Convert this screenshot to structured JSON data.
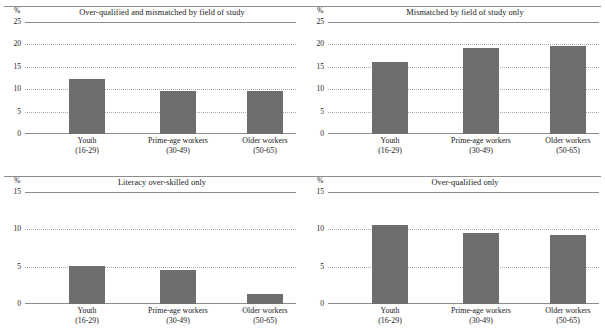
{
  "figure": {
    "bar_color": "#6e6e6e",
    "axis_color": "#8c8c8c",
    "grid_color": "#a8a8a8",
    "background": "#ffffff",
    "percent_symbol": "%"
  },
  "categories": [
    {
      "line1": "Youth",
      "line2": "(16-29)"
    },
    {
      "line1": "Prime-age workers",
      "line2": "(30-49)"
    },
    {
      "line1": "Older workers",
      "line2": "(50-65)"
    }
  ],
  "panels": [
    {
      "key": "over_qualified_and_mismatched",
      "title": "Over-qualified and mismatched by field of study",
      "unit": "%",
      "yticks": [
        "25",
        "20",
        "15",
        "10",
        "5",
        "0"
      ]
    },
    {
      "key": "mismatched_field_only",
      "title": "Mismatched by field of study only",
      "unit": "%",
      "yticks": [
        "25",
        "20",
        "15",
        "10",
        "5",
        "0"
      ]
    },
    {
      "key": "literacy_over_skilled_only",
      "title": "Literacy over-skilled only",
      "unit": "%",
      "yticks": [
        "15",
        "10",
        "5",
        "0"
      ]
    },
    {
      "key": "over_qualified_only",
      "title": "Over-qualified only",
      "unit": "%",
      "yticks": [
        "15",
        "10",
        "5",
        "0"
      ]
    }
  ],
  "chart_data": [
    {
      "type": "bar",
      "title": "Over-qualified and mismatched by field of study",
      "xlabel": "",
      "ylabel": "%",
      "categories": [
        "Youth (16-29)",
        "Prime-age workers (30-49)",
        "Older workers (50-65)"
      ],
      "values": [
        12.3,
        9.5,
        9.7
      ],
      "ylim": [
        0,
        25
      ],
      "yticks": [
        0,
        5,
        10,
        15,
        20,
        25
      ],
      "grid": true,
      "legend": "none"
    },
    {
      "type": "bar",
      "title": "Mismatched by field of study only",
      "xlabel": "",
      "ylabel": "%",
      "categories": [
        "Youth (16-29)",
        "Prime-age workers (30-49)",
        "Older workers (50-65)"
      ],
      "values": [
        16.1,
        19.2,
        19.6
      ],
      "ylim": [
        0,
        25
      ],
      "yticks": [
        0,
        5,
        10,
        15,
        20,
        25
      ],
      "grid": true,
      "legend": "none"
    },
    {
      "type": "bar",
      "title": "Literacy over-skilled only",
      "xlabel": "",
      "ylabel": "%",
      "categories": [
        "Youth (16-29)",
        "Prime-age workers (30-49)",
        "Older workers (50-65)"
      ],
      "values": [
        5.1,
        4.6,
        1.4
      ],
      "ylim": [
        0,
        15
      ],
      "yticks": [
        0,
        5,
        10,
        15
      ],
      "grid": true,
      "legend": "none"
    },
    {
      "type": "bar",
      "title": "Over-qualified only",
      "xlabel": "",
      "ylabel": "%",
      "categories": [
        "Youth (16-29)",
        "Prime-age workers (30-49)",
        "Older workers (50-65)"
      ],
      "values": [
        10.6,
        9.5,
        9.2
      ],
      "ylim": [
        0,
        15
      ],
      "yticks": [
        0,
        5,
        10,
        15
      ],
      "grid": true,
      "legend": "none"
    }
  ]
}
